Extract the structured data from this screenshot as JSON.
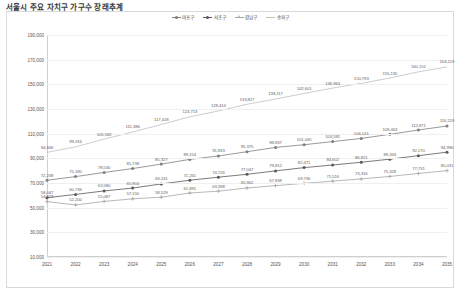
{
  "page_title": "서울시 주요 자치구 가구수 장래추계",
  "chart_data": {
    "type": "line",
    "title": "서울시 주요 자치구 가구수 장래추계",
    "xlabel": "",
    "ylabel": "",
    "ylim": [
      10000,
      190000
    ],
    "ytick_step": 20000,
    "grid": true,
    "legend_position": "top-center",
    "ytick_labels": [
      "190,000",
      "170,000",
      "150,000",
      "130,000",
      "110,000",
      "90,000",
      "70,000",
      "50,000",
      "30,000",
      "10,000"
    ],
    "categories": [
      "2021",
      "2022",
      "2023",
      "2024",
      "2025",
      "2026",
      "2027",
      "2028",
      "2029",
      "2030",
      "2031",
      "2032",
      "2033",
      "2034",
      "2035"
    ],
    "series": [
      {
        "name": "마포구",
        "color": "#7f7f7f",
        "marker": "circle",
        "values": [
          72238,
          75180,
          78530,
          81738,
          85327,
          89154,
          91933,
          95375,
          98837,
          101045,
          103581,
          106141,
          109463,
          112971,
          116219
        ]
      },
      {
        "name": "서초구",
        "color": "#595959",
        "marker": "circle",
        "values": [
          58047,
          60736,
          63580,
          65904,
          69241,
          72261,
          74726,
          77047,
          79812,
          82471,
          84602,
          86821,
          89343,
          92170,
          94996
        ]
      },
      {
        "name": "강남구",
        "color": "#a6a6a6",
        "marker": "plus",
        "values": [
          54923,
          52200,
          55087,
          57156,
          58529,
          61891,
          63398,
          65962,
          67838,
          69736,
          71516,
          73316,
          75328,
          77731,
          80031
        ]
      },
      {
        "name": "송파구",
        "color": "#bfbfbf",
        "marker": "none",
        "values": [
          94846,
          99316,
          105582,
          111386,
          117418,
          123713,
          128414,
          133827,
          138117,
          142601,
          146964,
          150793,
          155135,
          160152,
          164123
        ]
      }
    ]
  }
}
